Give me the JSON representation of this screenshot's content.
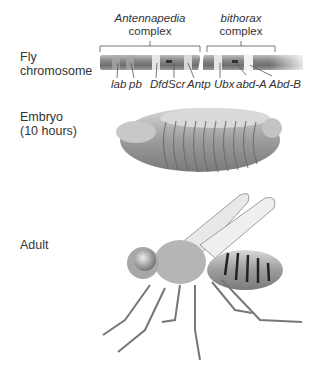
{
  "row_labels": {
    "chromosome": [
      "Fly",
      "chromosome"
    ],
    "embryo": [
      "Embryo",
      "(10 hours)"
    ],
    "adult": "Adult"
  },
  "complexes": [
    {
      "name": "Antennapedia",
      "suffix": "complex"
    },
    {
      "name": "bithorax",
      "suffix": "complex"
    }
  ],
  "genes": [
    {
      "label": "lab",
      "complex": "Antennapedia"
    },
    {
      "label": "pb",
      "complex": "Antennapedia"
    },
    {
      "label": "Dfd",
      "complex": "Antennapedia"
    },
    {
      "label": "Scr",
      "complex": "Antennapedia"
    },
    {
      "label": "Antp",
      "complex": "Antennapedia"
    },
    {
      "label": "Ubx",
      "complex": "bithorax"
    },
    {
      "label": "abd-A",
      "complex": "bithorax"
    },
    {
      "label": "Abd-B",
      "complex": "bithorax"
    }
  ]
}
